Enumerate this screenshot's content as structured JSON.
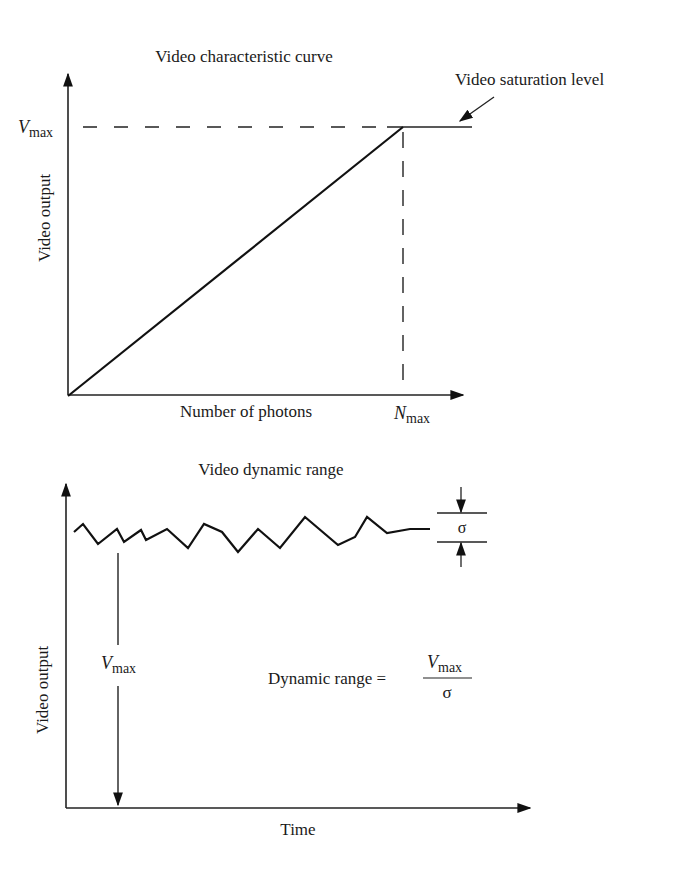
{
  "top_diagram": {
    "title": "Video characteristic curve",
    "y_axis_label": "Video output",
    "x_axis_label": "Number of photons",
    "vmax_label": {
      "main": "V",
      "sub": "max"
    },
    "nmax_label": {
      "main": "N",
      "sub": "max"
    },
    "saturation_label": "Video saturation level"
  },
  "bottom_diagram": {
    "title": "Video dynamic range",
    "y_axis_label": "Video output",
    "x_axis_label": "Time",
    "vmax_label": {
      "main": "V",
      "sub": "max"
    },
    "sigma_label": "σ",
    "formula": {
      "lhs": "Dynamic range =",
      "numerator": {
        "main": "V",
        "sub": "max"
      },
      "denominator": "σ"
    }
  }
}
